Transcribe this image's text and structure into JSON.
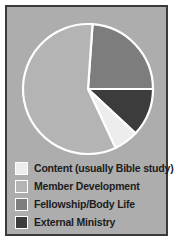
{
  "figure": {
    "background_color": "#ffffff",
    "panel_color": "#adadad",
    "border_color": "#3a3a3a"
  },
  "chart_data": {
    "type": "pie",
    "title": "",
    "subtitle": "",
    "xlabel": "",
    "ylabel": "",
    "grid": false,
    "legend_position": "bottom-left",
    "start_angle_deg": 4,
    "direction": "clockwise",
    "center": {
      "x": 86,
      "y": 87
    },
    "radius": 65,
    "wedge_edge_color": "#ffffff",
    "categories": [
      "Content (usually Bible study)",
      "Member Development",
      "Fellowship/Body Life",
      "External Ministry"
    ],
    "values": [
      6,
      58,
      24,
      12
    ],
    "colors": [
      "#ededed",
      "#b4b4b4",
      "#7d7d7d",
      "#3c3c3c"
    ],
    "slices": [
      {
        "label": "Content (usually Bible study)",
        "value": 6,
        "color": "#ededed",
        "start_deg": 133,
        "end_deg": 155
      },
      {
        "label": "Member Development",
        "value": 58,
        "color": "#b4b4b4",
        "start_deg": 155,
        "end_deg": 364
      },
      {
        "label": "Fellowship/Body Life",
        "value": 24,
        "color": "#7d7d7d",
        "start_deg": 4,
        "end_deg": 90
      },
      {
        "label": "External Ministry",
        "value": 12,
        "color": "#3c3c3c",
        "start_deg": 90,
        "end_deg": 133
      }
    ]
  },
  "legend": {
    "items": [
      {
        "label": "Content (usually Bible study)",
        "color": "#ededed"
      },
      {
        "label": "Member Development",
        "color": "#b4b4b4"
      },
      {
        "label": "Fellowship/Body Life",
        "color": "#7d7d7d"
      },
      {
        "label": "External Ministry",
        "color": "#3c3c3c"
      }
    ]
  }
}
